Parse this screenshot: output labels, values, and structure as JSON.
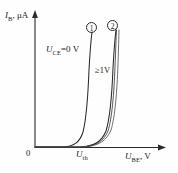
{
  "figure": {
    "background_color": "#fefefe",
    "line_color": "#2a2a2a"
  },
  "axes": {
    "y_symbol": "I",
    "y_subscript": "B",
    "y_unit": ", μA",
    "x_symbol": "U",
    "x_subscript": "BE",
    "x_unit": ", V",
    "origin_label": "0"
  },
  "annotations": {
    "threshold_symbol": "U",
    "threshold_subscript": "th",
    "uce_zero_symbol": "U",
    "uce_zero_subscript": "CE",
    "uce_zero_value": "=0 V",
    "uce_high_value": "≥1V",
    "curve_tag_1": "①",
    "curve_tag_2": "②"
  },
  "chart_data": {
    "type": "line",
    "xlabel": "U_BE, V",
    "ylabel": "I_B, μA",
    "grid": false,
    "legend": "none",
    "xlim": [
      0,
      1
    ],
    "ylim": [
      0,
      1
    ],
    "axis_arrows": true,
    "tick_labels": {
      "x": [
        "0",
        "U_th"
      ],
      "y": [
        "0"
      ]
    },
    "series": [
      {
        "name": "① U_CE=0 V",
        "label": "curve-1",
        "annotation": "U_CE=0 V",
        "comment": "Exponential diode-like input curve, knee at U_th, near-vertical rise",
        "points_px": "M35,147 L62,147 C74,146.6 80,142 83,132 C86,120 88,96 89,70 C90,52 91,40 92,32"
      },
      {
        "name": "② U_CE≥1V",
        "label": "curve-2",
        "annotation": "≥1V",
        "comment": "Shifted right; bundle of near-coincident curves for U_CE >= 1V",
        "points_px": "M35,147 L80,147 C95,146.4 102,141 106,131 C110,118 112,94 113,68 C114,50 115,38 116,30"
      },
      {
        "name": "② U_CE≥1V (b)",
        "label": "curve-2b",
        "annotation": "",
        "comment": "Second line of the >=1V bundle",
        "points_px": "M35,147 L81,147 C96,146.4 104,141 108,131 C112,118 114,94 115,66 C115.8,50 116,38 116.5,30"
      },
      {
        "name": "② U_CE≥1V (c)",
        "label": "curve-2c",
        "annotation": "",
        "comment": "Third, outermost line of the >=1V bundle",
        "points_px": "M35,147 L83,147 C99,146.4 107,140 111,130 C115,117 117,92 118,64 C118.6,48 118.8,37 119,30"
      }
    ],
    "markers": [
      {
        "name": "curve-tag-1",
        "text": "①",
        "x_px": 92,
        "y_px": 28
      },
      {
        "name": "curve-tag-2",
        "text": "②",
        "x_px": 113,
        "y_px": 26
      }
    ]
  }
}
